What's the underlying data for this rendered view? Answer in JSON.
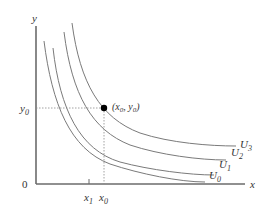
{
  "diagram": {
    "axes": {
      "x_label": "x",
      "y_label": "y",
      "origin_label": "0"
    },
    "x_ticks": [
      {
        "base": "x",
        "sub": "1"
      },
      {
        "base": "x",
        "sub": "0"
      }
    ],
    "y_ticks": [
      {
        "base": "y",
        "sub": "0"
      }
    ],
    "point": {
      "label": "(x0, y0)",
      "label_parts": {
        "open": "(",
        "x": "x",
        "xsub": "0",
        "sep": ", ",
        "y": "y",
        "ysub": "0",
        "close": ")"
      }
    },
    "curves": [
      {
        "base": "U",
        "sub": "0"
      },
      {
        "base": "U",
        "sub": "1"
      },
      {
        "base": "U",
        "sub": "2"
      },
      {
        "base": "U",
        "sub": "3"
      }
    ],
    "colors": {
      "axis": "#6b6b6b",
      "curve": "#7a7a7a",
      "guide": "#8a8a8a",
      "point": "#000000",
      "text": "#333333"
    }
  }
}
